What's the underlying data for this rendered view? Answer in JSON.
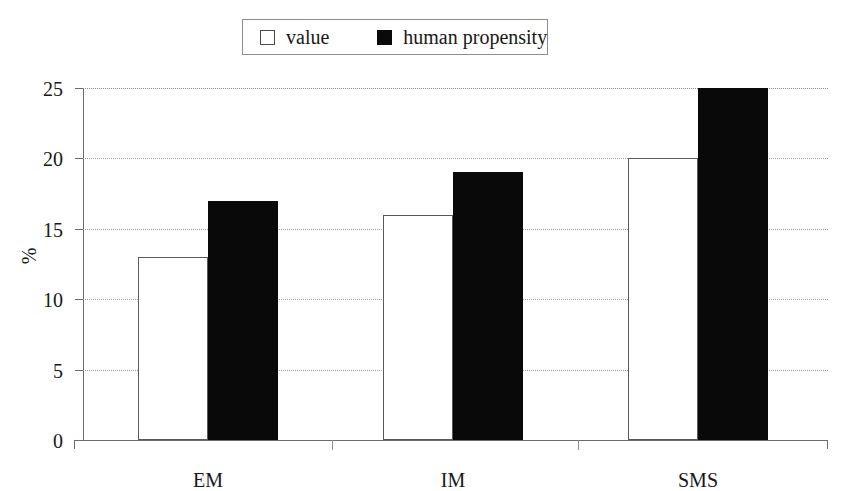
{
  "chart_data": {
    "type": "bar",
    "title": "",
    "xlabel": "",
    "ylabel": "%",
    "categories": [
      "EM",
      "IM",
      "SMS"
    ],
    "series": [
      {
        "name": "value",
        "values": [
          13,
          16,
          20
        ],
        "swatch": "open",
        "color": "#ffffff"
      },
      {
        "name": "human propensity",
        "values": [
          17,
          19,
          25
        ],
        "swatch": "filled",
        "color": "#090909"
      }
    ],
    "yticks": [
      0,
      5,
      10,
      15,
      20,
      25
    ],
    "ytick_labels": [
      "0",
      "5",
      "10",
      "15",
      "20",
      "25"
    ],
    "ylim": [
      0,
      25
    ],
    "grid": true,
    "legend_position": "top-center"
  },
  "legend": {
    "entries": [
      {
        "label": "value"
      },
      {
        "label": "human propensity"
      }
    ]
  },
  "axes": {
    "ylabel": "%",
    "ytick_labels": [
      "25",
      "20",
      "15",
      "10",
      "5",
      "0"
    ],
    "category_labels": [
      "EM",
      "IM",
      "SMS"
    ]
  }
}
